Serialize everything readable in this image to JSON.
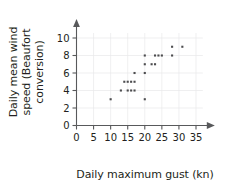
{
  "chart_data": {
    "type": "scatter",
    "title": "",
    "xlabel": "Daily maximum gust (kn)",
    "ylabel": "Daily mean wind speed (Beaufort conversion)",
    "ylabel_lines": [
      "Daily mean wind",
      "speed (Beaufort",
      "conversion)"
    ],
    "xlim": [
      0,
      37
    ],
    "ylim": [
      0,
      10.8
    ],
    "xticks": [
      0,
      5,
      10,
      15,
      20,
      25,
      30,
      35
    ],
    "xtick_labels": [
      "0",
      "5",
      "10",
      "15",
      "20",
      "25",
      "30",
      "35"
    ],
    "yticks": [
      0,
      2,
      4,
      6,
      8,
      10
    ],
    "ytick_labels": [
      "0",
      "2",
      "4",
      "6",
      "8",
      "10"
    ],
    "grid": true,
    "grid_color": "#e8e8ea",
    "marker_color": "#4d4d4f",
    "marker_size": 2.1,
    "axis_color": "#58595b",
    "legend": null,
    "points": [
      {
        "x": 10,
        "y": 3
      },
      {
        "x": 13,
        "y": 4
      },
      {
        "x": 15,
        "y": 4
      },
      {
        "x": 16,
        "y": 4
      },
      {
        "x": 17,
        "y": 4
      },
      {
        "x": 14,
        "y": 5
      },
      {
        "x": 15,
        "y": 5
      },
      {
        "x": 16,
        "y": 5
      },
      {
        "x": 17,
        "y": 5
      },
      {
        "x": 17,
        "y": 6
      },
      {
        "x": 20,
        "y": 3
      },
      {
        "x": 20,
        "y": 6
      },
      {
        "x": 20,
        "y": 7
      },
      {
        "x": 22,
        "y": 7
      },
      {
        "x": 23,
        "y": 7
      },
      {
        "x": 20,
        "y": 8
      },
      {
        "x": 23,
        "y": 8
      },
      {
        "x": 24,
        "y": 8
      },
      {
        "x": 25,
        "y": 8
      },
      {
        "x": 28,
        "y": 8
      },
      {
        "x": 28,
        "y": 9
      },
      {
        "x": 31,
        "y": 9
      }
    ]
  }
}
